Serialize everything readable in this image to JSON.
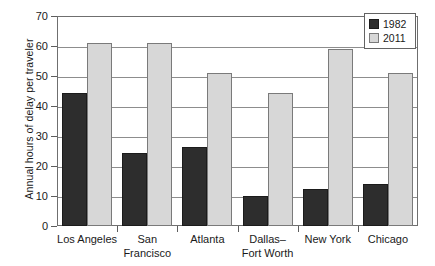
{
  "chart_data": {
    "type": "bar",
    "title": "",
    "xlabel": "",
    "ylabel": "Annual hours of delay per traveler",
    "ylim": [
      0,
      70
    ],
    "yticks": [
      0,
      10,
      20,
      30,
      40,
      50,
      60,
      70
    ],
    "grid": true,
    "legend_position": "top-right",
    "categories": [
      "Los Angeles",
      "San Francisco",
      "Atlanta",
      "Dallas–Fort Worth",
      "New York",
      "Chicago"
    ],
    "category_lines": [
      [
        "Los Angeles"
      ],
      [
        "San",
        "Francisco"
      ],
      [
        "Atlanta"
      ],
      [
        "Dallas–",
        "Fort Worth"
      ],
      [
        "New York"
      ],
      [
        "Chicago"
      ]
    ],
    "series": [
      {
        "name": "1982",
        "color": "#2d2d2d",
        "values": [
          44.5,
          24.5,
          26.5,
          10.0,
          12.3,
          14.0
        ]
      },
      {
        "name": "2011",
        "color": "#d7d7d7",
        "values": [
          61.0,
          61.0,
          51.0,
          44.5,
          59.0,
          51.0
        ]
      }
    ]
  },
  "legend": {
    "items": [
      {
        "label": "1982",
        "swatch": "dark"
      },
      {
        "label": "2011",
        "swatch": "light"
      }
    ]
  },
  "axis": {
    "y_title": "Annual hours of delay per traveler",
    "y_tick_labels": [
      "70",
      "60",
      "50",
      "40",
      "30",
      "20",
      "10",
      "0"
    ]
  }
}
